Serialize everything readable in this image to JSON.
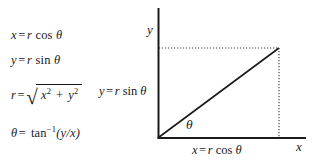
{
  "figure": {
    "colors": {
      "ink": "#1a1a1a",
      "background": "#ffffff",
      "axis": "#1a1a1a",
      "dotted": "#3a3a3a"
    }
  },
  "equations": {
    "x_polar": {
      "lhs": "x",
      "eq": "=",
      "r": "r",
      "fn": "cos",
      "angle": "θ",
      "full": "x = r cos θ"
    },
    "y_polar": {
      "lhs": "y",
      "eq": "=",
      "r": "r",
      "fn": "sin",
      "angle": "θ",
      "full": "y = r sin θ"
    },
    "r_polar": {
      "lhs": "r",
      "eq": "=",
      "radical_sign": "√",
      "term1": "x",
      "exp1": "2",
      "plus": "+",
      "term2": "y",
      "exp2": "2",
      "full": "r = √(x² + y²)"
    },
    "theta_polar": {
      "lhs": "θ",
      "eq": "=",
      "fn": "tan",
      "exp": "−1",
      "arg": "(y/x)",
      "full": "θ = tan⁻¹(y/x)"
    }
  },
  "diagram": {
    "axis_labels": {
      "y": "y",
      "x": "x"
    },
    "leg_labels": {
      "vertical": "y = r sin θ",
      "horizontal": "x = r cos θ"
    },
    "angle_label": "θ",
    "geometry": {
      "origin": [
        158,
        138
      ],
      "y_axis_top": [
        158,
        8
      ],
      "x_axis_right": [
        306,
        138
      ],
      "point": [
        279,
        48
      ],
      "hypotenuse": [
        [
          158,
          138
        ],
        [
          279,
          48
        ]
      ],
      "dotted_horizontal": [
        [
          158,
          48
        ],
        [
          279,
          48
        ]
      ],
      "dotted_vertical": [
        [
          279,
          48
        ],
        [
          279,
          138
        ]
      ],
      "angle_arc_degrees": 36.6
    }
  }
}
